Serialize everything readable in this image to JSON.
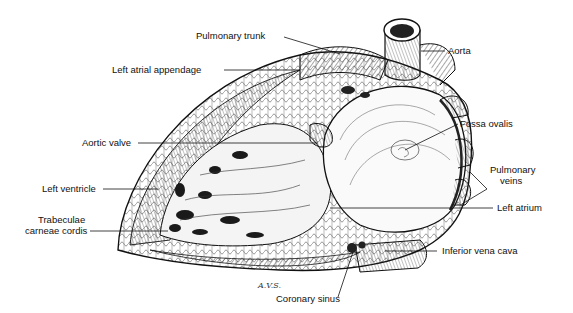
{
  "figure": {
    "signature": "A.V.S."
  },
  "labels": {
    "pulmonary_trunk": "Pulmonary trunk",
    "aorta": "Aorta",
    "left_atrial_appendage": "Left atrial appendage",
    "fossa_ovalis": "Fossa ovalis",
    "aortic_valve": "Aortic valve",
    "pulmonary_veins_1": "Pulmonary",
    "pulmonary_veins_2": "veins",
    "left_ventricle": "Left ventricle",
    "left_atrium": "Left atrium",
    "trabeculae_1": "Trabeculae",
    "trabeculae_2": "carneae cordis",
    "inferior_vena_cava": "Inferior vena cava",
    "coronary_sinus": "Coronary sinus"
  },
  "colors": {
    "ink": "#111111",
    "background": "#ffffff"
  }
}
